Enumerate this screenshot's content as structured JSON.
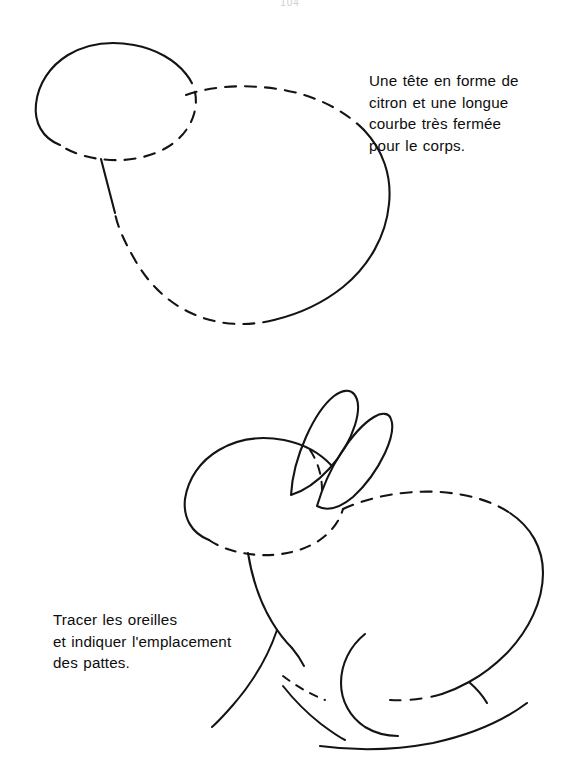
{
  "page": {
    "width": 582,
    "height": 778,
    "background_color": "#ffffff",
    "ink_color": "#141414",
    "artifact_text": "104"
  },
  "captions": {
    "head_body": "Une tête en forme de\ncitron et une longue\ncourbe très fermée\npour le corps.",
    "ears_legs": "Tracer les oreilles\net indiquer l'emplacement\ndes pattes."
  },
  "figures": [
    {
      "id": "step-1",
      "name": "head-and-body-construction",
      "description": "Forme de tête en citron et grande courbe fermée du corps"
    },
    {
      "id": "step-2",
      "name": "ears-and-leg-placement",
      "description": "Lapin avec oreilles tracées et emplacement des pattes"
    }
  ],
  "strokes": {
    "solid_width": 2.1,
    "dash_pattern": "10 10",
    "thin_width": 1.9
  }
}
